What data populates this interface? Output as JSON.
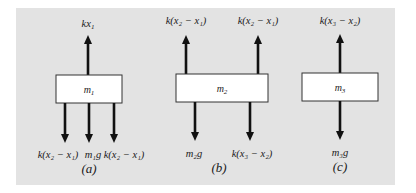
{
  "colors": {
    "background": "#ffffff",
    "panel": "#e3e3e3",
    "box_fill": "#ffffff",
    "box_stroke": "#333333",
    "arrow": "#111111"
  },
  "diagrams": [
    {
      "id": "a",
      "caption": "(a)",
      "mass": {
        "base": "m",
        "sub": "1"
      },
      "forces_up": [
        {
          "label": "kx₁",
          "parts": [
            "kx",
            "1"
          ]
        }
      ],
      "forces_down": [
        {
          "label": "k(x₂ − x₁)"
        },
        {
          "label": "m₁g"
        },
        {
          "label": "k(x₂ − x₁)"
        }
      ]
    },
    {
      "id": "b",
      "caption": "(b)",
      "mass": {
        "base": "m",
        "sub": "2"
      },
      "forces_up": [
        {
          "label": "k(x₂ − x₁)"
        },
        {
          "label": "k(x₂ − x₁)"
        }
      ],
      "forces_down": [
        {
          "label": "m₂g"
        },
        {
          "label": "k(x₃ − x₂)"
        }
      ]
    },
    {
      "id": "c",
      "caption": "(c)",
      "mass": {
        "base": "m",
        "sub": "3"
      },
      "forces_up": [
        {
          "label": "k(x₃ − x₂)"
        }
      ],
      "forces_down": [
        {
          "label": "m₃g"
        }
      ]
    }
  ]
}
